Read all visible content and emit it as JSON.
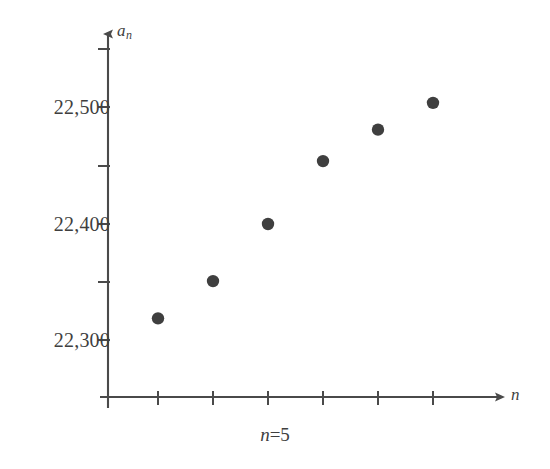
{
  "chart_data": {
    "type": "scatter",
    "title": "",
    "subtitle": "",
    "xlabel": "n",
    "ylabel": "a_n",
    "ylabel_display": "a",
    "ylabel_subscript": "n",
    "annotation": "n=5",
    "annotation_variable": "n",
    "annotation_rest": "=5",
    "grid": false,
    "legend": null,
    "x": [
      1,
      2,
      3,
      4,
      5,
      6
    ],
    "values": [
      22319,
      22351,
      22400,
      22454,
      22481,
      22504
    ],
    "points": [
      {
        "x": 1,
        "y": 22319
      },
      {
        "x": 2,
        "y": 22351
      },
      {
        "x": 3,
        "y": 22400
      },
      {
        "x": 4,
        "y": 22454
      },
      {
        "x": 5,
        "y": 22481
      },
      {
        "x": 6,
        "y": 22504
      }
    ],
    "ylim": [
      22230,
      22560
    ],
    "xlim": [
      0,
      7
    ],
    "y_ticks": [
      22300,
      22350,
      22400,
      22450,
      22500,
      22550
    ],
    "y_tick_labels": [
      "22,300",
      "",
      "22,400",
      "",
      "22,500",
      ""
    ],
    "x_ticks": [
      1,
      2,
      3,
      4,
      5,
      6
    ],
    "x_tick_labels": [
      "",
      "",
      "",
      "",
      "",
      ""
    ],
    "marker_color": "#3f3f3f",
    "axis_color": "#4a4a4a"
  },
  "axis": {
    "y_label_main": "a",
    "y_label_sub": "n",
    "x_label": "n"
  },
  "y_axis_labels": [
    {
      "text": "22,500",
      "value": 22500
    },
    {
      "text": "22,400",
      "value": 22400
    },
    {
      "text": "22,300",
      "value": 22300
    }
  ],
  "caption": {
    "variable": "n",
    "rest": "=5"
  },
  "colors": {
    "marker": "#3f3f3f",
    "axis": "#4a4a4a",
    "background": "#ffffff",
    "text": "#3f3f3f"
  }
}
